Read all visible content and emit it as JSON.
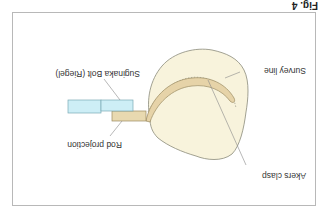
{
  "figure": {
    "label": "Fig. 4",
    "orientation": "rotated 180 degrees"
  },
  "labels": {
    "bolt": "Suginaka Bolt (Riegel)",
    "survey_line": "Survey line",
    "rod_projection": "Rod projection",
    "akers_clasp": "Akers clasp"
  },
  "colors": {
    "tooth_fill": "#f8f3dc",
    "tooth_stroke": "#8a8a7a",
    "clasp_fill": "#e6d3a8",
    "clasp_stroke": "#9a8a60",
    "rod_fill": "#e8d9b0",
    "bolt_fill": "#cdeef6",
    "bolt_stroke": "#7aa9b5",
    "frame_stroke": "#b8b8b8"
  }
}
